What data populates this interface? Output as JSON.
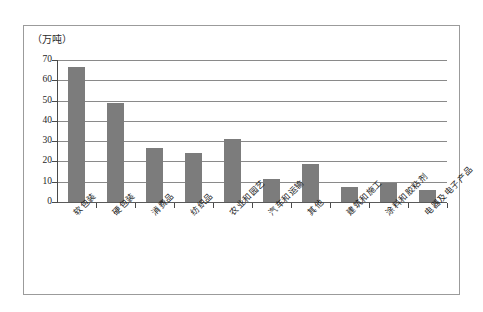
{
  "chart_data": {
    "type": "bar",
    "title": "",
    "unit_label": "（万吨）",
    "xlabel": "",
    "ylabel": "",
    "ylim": [
      0,
      70
    ],
    "ytick_labels": [
      "70",
      "60",
      "50",
      "40",
      "30",
      "20",
      "10",
      "0"
    ],
    "ytick_values": [
      70,
      60,
      50,
      40,
      30,
      20,
      10,
      0
    ],
    "grid": true,
    "legend": "none",
    "categories": [
      "软包装",
      "硬包装",
      "消费品",
      "纺织品",
      "农业和园艺",
      "汽车和运输",
      "其他",
      "建筑和施工",
      "涂料和胶粘剂",
      "电器及电子产品"
    ],
    "values": [
      66.5,
      49,
      26.5,
      24,
      31,
      11.5,
      18.5,
      7.5,
      9.5,
      6
    ],
    "series": [
      {
        "name": "",
        "values": [
          66.5,
          49,
          26.5,
          24,
          31,
          11.5,
          18.5,
          7.5,
          9.5,
          6
        ]
      }
    ],
    "colors": {
      "bar": "#7c7c7c",
      "gridline": "#8a8a8a",
      "axis": "#4a4a4a",
      "frame": "#9b9b9b",
      "text": "#1a1a1a",
      "background": "#ffffff"
    }
  }
}
